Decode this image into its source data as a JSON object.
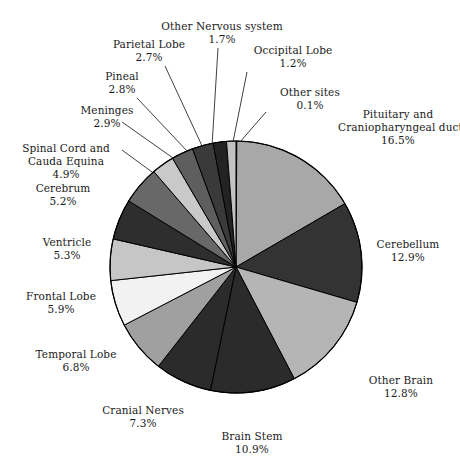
{
  "chart_data": {
    "type": "pie",
    "title": "",
    "subtitle": "",
    "xlabel": "",
    "ylabel": "",
    "legend_position": "none",
    "grid": false,
    "value_unit": "percent",
    "start_angle_deg": 0,
    "direction": "clockwise",
    "categories": [
      "Other sites",
      "Pituitary and Craniopharyngeal duct",
      "Cerebellum",
      "Other Brain",
      "Brain Stem",
      "Cranial Nerves",
      "Temporal Lobe",
      "Frontal Lobe",
      "Ventricle",
      "Cerebrum",
      "Spinal Cord and Cauda Equina",
      "Meninges",
      "Pineal",
      "Parietal Lobe",
      "Other Nervous system",
      "Occipital Lobe"
    ],
    "values": [
      0.1,
      16.5,
      12.9,
      12.8,
      10.9,
      7.3,
      6.8,
      5.9,
      5.3,
      5.2,
      4.9,
      2.9,
      2.8,
      2.7,
      1.7,
      1.2
    ],
    "slices": [
      {
        "label": "Other sites",
        "label_line1": "Other sites",
        "label_line2": "0.1%",
        "value": 0.1,
        "pct_text": "0.1%",
        "color": "#9a9a9a"
      },
      {
        "label": "Pituitary and Craniopharyngeal duct",
        "label_line1": "Pituitary and",
        "label_line2": "Craniopharyngeal duct",
        "label_line3": "16.5%",
        "value": 16.5,
        "pct_text": "16.5%",
        "color": "#a8a8a8"
      },
      {
        "label": "Cerebellum",
        "label_line1": "Cerebellum",
        "label_line2": "12.9%",
        "value": 12.9,
        "pct_text": "12.9%",
        "color": "#333333"
      },
      {
        "label": "Other Brain",
        "label_line1": "Other Brain",
        "label_line2": "12.8%",
        "value": 12.8,
        "pct_text": "12.8%",
        "color": "#b5b5b5"
      },
      {
        "label": "Brain Stem",
        "label_line1": "Brain Stem",
        "label_line2": "10.9%",
        "value": 10.9,
        "pct_text": "10.9%",
        "color": "#2b2b2b"
      },
      {
        "label": "Cranial Nerves",
        "label_line1": "Cranial Nerves",
        "label_line2": "7.3%",
        "value": 7.3,
        "pct_text": "7.3%",
        "color": "#2b2b2b"
      },
      {
        "label": "Temporal Lobe",
        "label_line1": "Temporal Lobe",
        "label_line2": "6.8%",
        "value": 6.8,
        "pct_text": "6.8%",
        "color": "#a0a0a0"
      },
      {
        "label": "Frontal Lobe",
        "label_line1": "Frontal Lobe",
        "label_line2": "5.9%",
        "value": 5.9,
        "pct_text": "5.9%",
        "color": "#f2f2f2"
      },
      {
        "label": "Ventricle",
        "label_line1": "Ventricle",
        "label_line2": "5.3%",
        "value": 5.3,
        "pct_text": "5.3%",
        "color": "#c6c6c6"
      },
      {
        "label": "Cerebrum",
        "label_line1": "Cerebrum",
        "label_line2": "5.2%",
        "value": 5.2,
        "pct_text": "5.2%",
        "color": "#2e2e2e"
      },
      {
        "label": "Spinal Cord and Cauda Equina",
        "label_line1": "Spinal Cord and",
        "label_line2": "Cauda Equina",
        "label_line3": "4.9%",
        "value": 4.9,
        "pct_text": "4.9%",
        "color": "#686868"
      },
      {
        "label": "Meninges",
        "label_line1": "Meninges",
        "label_line2": "2.9%",
        "value": 2.9,
        "pct_text": "2.9%",
        "color": "#c9c9c9"
      },
      {
        "label": "Pineal",
        "label_line1": "Pineal",
        "label_line2": "2.8%",
        "value": 2.8,
        "pct_text": "2.8%",
        "color": "#5e5e5e"
      },
      {
        "label": "Parietal Lobe",
        "label_line1": "Parietal Lobe",
        "label_line2": "2.7%",
        "value": 2.7,
        "pct_text": "2.7%",
        "color": "#3a3a3a"
      },
      {
        "label": "Other Nervous system",
        "label_line1": "Other Nervous system",
        "label_line2": "1.7%",
        "value": 1.7,
        "pct_text": "1.7%",
        "color": "#232323"
      },
      {
        "label": "Occipital Lobe",
        "label_line1": "Occipital Lobe",
        "label_line2": "1.2%",
        "value": 1.2,
        "pct_text": "1.2%",
        "color": "#c2c2c2"
      }
    ]
  },
  "geometry": {
    "center_x": 236,
    "center_y": 267,
    "radius": 126,
    "stroke_color": "#000000",
    "background": "#ffffff",
    "text_color": "#1a1a1a"
  },
  "labels": [
    {
      "key": "other-nervous-system",
      "x": 152,
      "y": 20,
      "w": 140,
      "align": "al-c",
      "line1": "Other Nervous system",
      "line2": "1.7%",
      "leader": [
        [
          218,
          48
        ],
        [
          212,
          146
        ]
      ]
    },
    {
      "key": "parietal-lobe",
      "x": 94,
      "y": 38,
      "w": 110,
      "align": "al-c",
      "line1": "Parietal Lobe",
      "line2": "2.7%",
      "leader": [
        [
          165,
          66
        ],
        [
          203,
          148
        ]
      ]
    },
    {
      "key": "occipital-lobe",
      "x": 238,
      "y": 44,
      "w": 110,
      "align": "al-c",
      "line1": "Occipital Lobe",
      "line2": "1.2%",
      "leader": [
        [
          247,
          72
        ],
        [
          233,
          142
        ]
      ]
    },
    {
      "key": "pineal",
      "x": 76,
      "y": 70,
      "w": 92,
      "align": "al-c",
      "line1": "Pineal",
      "line2": "2.8%",
      "leader": [
        [
          137,
          98
        ],
        [
          188,
          152
        ]
      ]
    },
    {
      "key": "other-sites",
      "x": 255,
      "y": 86,
      "w": 110,
      "align": "al-c",
      "line1": "Other sites",
      "line2": "0.1%",
      "leader": [
        [
          266,
          112
        ],
        [
          240,
          142
        ]
      ]
    },
    {
      "key": "meninges",
      "x": 57,
      "y": 104,
      "w": 100,
      "align": "al-c",
      "line1": "Meninges",
      "line2": "2.9%",
      "leader": [
        [
          122,
          122
        ],
        [
          173,
          158
        ]
      ]
    },
    {
      "key": "pituitary",
      "x": 338,
      "y": 108,
      "w": 120,
      "align": "al-c",
      "line1": "Pituitary and",
      "line2": "Craniopharyngeal duct",
      "line3": "16.5%",
      "leader": null
    },
    {
      "key": "spinal-cord",
      "x": 8,
      "y": 142,
      "w": 116,
      "align": "al-c",
      "line1": "Spinal Cord and",
      "line2": "Cauda Equina",
      "line3": "4.9%",
      "leader": [
        [
          122,
          150
        ],
        [
          152,
          172
        ]
      ]
    },
    {
      "key": "cerebrum",
      "x": 10,
      "y": 182,
      "w": 106,
      "align": "al-c",
      "line1": "Cerebrum",
      "line2": "5.2%",
      "leader": null
    },
    {
      "key": "ventricle",
      "x": 18,
      "y": 236,
      "w": 98,
      "align": "al-c",
      "line1": "Ventricle",
      "line2": "5.3%",
      "leader": null
    },
    {
      "key": "cerebellum",
      "x": 358,
      "y": 238,
      "w": 100,
      "align": "al-c",
      "line1": "Cerebellum",
      "line2": "12.9%",
      "leader": null
    },
    {
      "key": "frontal-lobe",
      "x": 8,
      "y": 290,
      "w": 106,
      "align": "al-c",
      "line1": "Frontal Lobe",
      "line2": "5.9%",
      "leader": null
    },
    {
      "key": "temporal-lobe",
      "x": 18,
      "y": 348,
      "w": 116,
      "align": "al-c",
      "line1": "Temporal Lobe",
      "line2": "6.8%",
      "leader": null
    },
    {
      "key": "other-brain",
      "x": 348,
      "y": 374,
      "w": 106,
      "align": "al-c",
      "line1": "Other Brain",
      "line2": "12.8%",
      "leader": null
    },
    {
      "key": "cranial-nerves",
      "x": 82,
      "y": 404,
      "w": 122,
      "align": "al-c",
      "line1": "Cranial Nerves",
      "line2": "7.3%",
      "leader": null
    },
    {
      "key": "brain-stem",
      "x": 196,
      "y": 430,
      "w": 112,
      "align": "al-c",
      "line1": "Brain Stem",
      "line2": "10.9%",
      "leader": null
    }
  ]
}
